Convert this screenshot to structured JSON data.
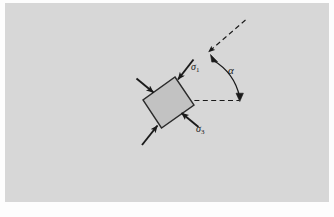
{
  "figure": {
    "name": "stress-element-orientation-diagram",
    "panel_background_color": "#d7d7d7",
    "page_background_color": "#fdfdfd",
    "line_color": "#1a1a1a",
    "specimen_fill_color": "#c2c2c2",
    "specimen_stroke_color": "#2b2b2b"
  },
  "labels": {
    "sigma1": {
      "symbol": "σ",
      "subscript": "1",
      "text": "σ₁",
      "x": 193,
      "y": 69
    },
    "sigma3": {
      "symbol": "σ",
      "subscript": "3",
      "text": "σ₃",
      "x": 198,
      "y": 131
    },
    "alpha": {
      "symbol": "α",
      "text": "α",
      "x": 230,
      "y": 72
    }
  },
  "specimen": {
    "name": "rock-specimen-rectangle",
    "corners": [
      {
        "x": 175.0,
        "y": 77.0
      },
      {
        "x": 194.0,
        "y": 105.0
      },
      {
        "x": 161.5,
        "y": 128.0
      },
      {
        "x": 143.0,
        "y": 100.0
      }
    ],
    "center": {
      "x": 168.4,
      "y": 102.5
    },
    "rotation_deg": -55
  },
  "arrows": {
    "sigma1_top_right": {
      "name": "sigma1-arrow-upper",
      "from": {
        "x": 192.0,
        "y": 61.0
      },
      "to": {
        "x": 177.0,
        "y": 80.5
      }
    },
    "sigma1_bottom_left": {
      "name": "sigma1-arrow-lower",
      "from": {
        "x": 143.5,
        "y": 143.0
      },
      "to": {
        "x": 158.5,
        "y": 124.5
      }
    },
    "sigma3_right": {
      "name": "sigma3-arrow-right",
      "from": {
        "x": 196.0,
        "y": 125.0
      },
      "to": {
        "x": 180.0,
        "y": 112.0
      }
    },
    "sigma3_left": {
      "name": "sigma3-arrow-left",
      "from": {
        "x": 138.0,
        "y": 80.0
      },
      "to": {
        "x": 155.0,
        "y": 93.5
      }
    }
  },
  "angle": {
    "vertex": {
      "x": 208.0,
      "y": 100.0
    },
    "inclined_dashed_line": {
      "name": "inclined-reference-dashed-line",
      "from": {
        "x": 206.0,
        "y": 54.0
      },
      "to": {
        "x": 245.5,
        "y": 20.0
      }
    },
    "horizontal_dashed_line": {
      "name": "horizontal-reference-dashed-line",
      "from": {
        "x": 186.0,
        "y": 100.5
      },
      "to": {
        "x": 239.5,
        "y": 100.5
      }
    },
    "arc": {
      "name": "alpha-angle-arc",
      "start": {
        "x": 211.0,
        "y": 57.0
      },
      "end": {
        "x": 239.5,
        "y": 97.0
      },
      "radius": 50,
      "double_headed": true
    },
    "arc_arrow_up": {
      "name": "alpha-arc-arrowhead-upper",
      "direction": "up-left"
    },
    "arc_arrow_down": {
      "name": "alpha-arc-arrowhead-lower",
      "direction": "down"
    }
  }
}
